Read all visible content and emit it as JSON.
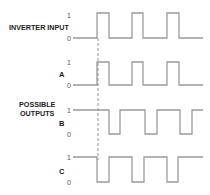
{
  "diagram": {
    "type": "timing-diagram",
    "labels": {
      "input": "INVERTER INPUT",
      "possible_outputs_line1": "POSSIBLE",
      "possible_outputs_line2": "OUTPUTS",
      "a": "A",
      "b": "B",
      "c": "C"
    },
    "level_high": "1",
    "level_low": "0",
    "line_color": "#9a9a9a",
    "signals": [
      {
        "name": "INVERTER INPUT",
        "high_y": 13,
        "low_y": 38,
        "start": 0,
        "edges": [
          97,
          109,
          132,
          143,
          167,
          179
        ],
        "x_start": 73,
        "x_end": 203
      },
      {
        "name": "A",
        "high_y": 62,
        "low_y": 85,
        "start": 0,
        "edges": [
          97,
          109,
          132,
          143,
          167,
          179
        ],
        "x_start": 73,
        "x_end": 203
      },
      {
        "name": "B",
        "high_y": 110,
        "low_y": 134,
        "start": 1,
        "edges": [
          109,
          120,
          145,
          157,
          180,
          192
        ],
        "x_start": 73,
        "x_end": 203
      },
      {
        "name": "C",
        "high_y": 157,
        "low_y": 182,
        "start": 1,
        "edges": [
          97,
          109,
          132,
          144,
          167,
          178
        ],
        "x_start": 73,
        "x_end": 203
      }
    ],
    "reference_line": {
      "x": 98,
      "y1": 38,
      "y2": 160,
      "style": "dashed"
    }
  }
}
